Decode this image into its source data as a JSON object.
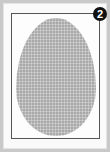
{
  "figure": {
    "badge": {
      "label": "2",
      "color": "#111111",
      "text_color": "#ffffff"
    },
    "shape": {
      "name": "egg",
      "fill_color": "#a9a9a9",
      "pattern": "grid"
    },
    "frame": {
      "border_color": "#555555"
    },
    "background_color": "#c9c9c9",
    "panel_color": "#fafafa"
  }
}
